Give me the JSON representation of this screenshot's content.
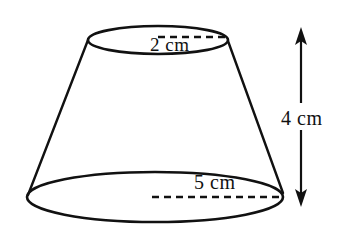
{
  "figure": {
    "shape": "frustum",
    "stroke_color": "#111111",
    "fill_color": "#ffffff",
    "background_color": "#ffffff",
    "labels": {
      "top_radius": "2 cm",
      "bottom_radius": "5 cm",
      "height": "4 cm"
    },
    "measurements": [
      {
        "name": "top-radius",
        "value": 2,
        "unit": "cm",
        "text": "2 cm"
      },
      {
        "name": "bottom-radius",
        "value": 5,
        "unit": "cm",
        "text": "5 cm"
      },
      {
        "name": "height",
        "value": 4,
        "unit": "cm",
        "text": "4 cm"
      }
    ],
    "icons": {
      "height_arrow": "double-headed-vertical-arrow",
      "radius_line": "dashed-line"
    }
  }
}
